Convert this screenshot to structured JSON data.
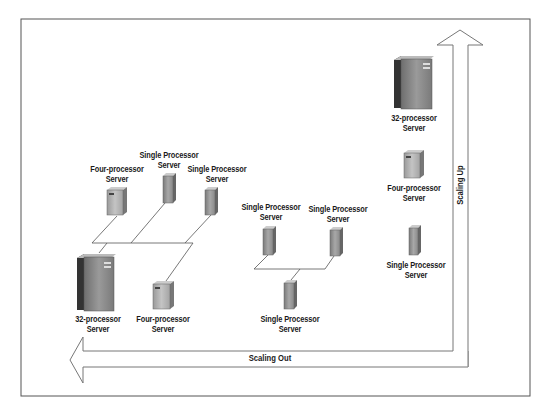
{
  "diagram": {
    "title": "",
    "colors": {
      "frame": "#555555",
      "arrow_outline": "#666666",
      "connector": "#555555",
      "server_dark": "#3a3a3a",
      "server_front": "#8a8a8a",
      "server_light": "#c8c8c8",
      "text": "#1a1a1a"
    },
    "axes": {
      "horizontal": {
        "label": "Scaling Out",
        "direction": "left"
      },
      "vertical": {
        "label": "Scaling Up",
        "direction": "up"
      }
    },
    "groups": {
      "scale_out_mixed": {
        "nodes": [
          {
            "id": "s1",
            "type": "four-processor",
            "label_line1": "Four-processor",
            "label_line2": "Server",
            "icon": "four-processor-server-icon"
          },
          {
            "id": "s2",
            "type": "single-processor",
            "label_line1": "Single Processor",
            "label_line2": "Server",
            "icon": "single-processor-server-icon"
          },
          {
            "id": "s3",
            "type": "single-processor",
            "label_line1": "Single Processor",
            "label_line2": "Server",
            "icon": "single-processor-server-icon"
          },
          {
            "id": "s4",
            "type": "32-processor",
            "label_line1": "32-processor",
            "label_line2": "Server",
            "icon": "32-processor-server-icon"
          },
          {
            "id": "s5",
            "type": "four-processor",
            "label_line1": "Four-processor",
            "label_line2": "Server",
            "icon": "four-processor-server-icon"
          }
        ]
      },
      "scale_out_single": {
        "nodes": [
          {
            "id": "m1",
            "type": "single-processor",
            "label_line1": "Single Processor",
            "label_line2": "Server",
            "icon": "single-processor-server-icon"
          },
          {
            "id": "m2",
            "type": "single-processor",
            "label_line1": "Single Processor",
            "label_line2": "Server",
            "icon": "single-processor-server-icon"
          },
          {
            "id": "m3",
            "type": "single-processor",
            "label_line1": "Single Processor",
            "label_line2": "Server",
            "icon": "single-processor-server-icon"
          }
        ]
      },
      "scale_up_stack": {
        "nodes": [
          {
            "id": "u1",
            "type": "32-processor",
            "label_line1": "32-processor",
            "label_line2": "Server",
            "icon": "32-processor-server-icon"
          },
          {
            "id": "u2",
            "type": "four-processor",
            "label_line1": "Four-processor",
            "label_line2": "Server",
            "icon": "four-processor-server-icon"
          },
          {
            "id": "u3",
            "type": "single-processor",
            "label_line1": "Single Processor",
            "label_line2": "Server",
            "icon": "single-processor-server-icon"
          }
        ]
      }
    }
  }
}
